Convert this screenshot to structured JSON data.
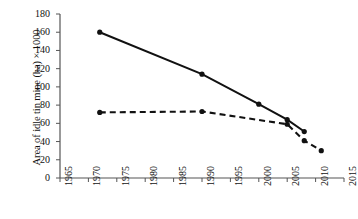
{
  "chart_data": {
    "type": "line",
    "title": "",
    "subtitle": "",
    "xlabel": "",
    "ylabel": "Area of idle tin mine (ha) × 1000",
    "xlim": [
      1965,
      2015
    ],
    "ylim": [
      0,
      180
    ],
    "grid": false,
    "legend": "none",
    "x_ticks": [
      "1965",
      "1970",
      "1975",
      "1980",
      "1985",
      "1990",
      "1995",
      "2000",
      "2005",
      "2010",
      "2015"
    ],
    "y_ticks": [
      "0",
      "20",
      "40",
      "60",
      "80",
      "100",
      "120",
      "140",
      "160",
      "180"
    ],
    "series": [
      {
        "name": "solid-series",
        "style": "solid",
        "color": "#111111",
        "marker": "circle",
        "x": [
          1972,
          1990,
          2000,
          2005,
          2008
        ],
        "values": [
          160,
          114,
          81,
          64,
          51
        ]
      },
      {
        "name": "dashed-series",
        "style": "dashed",
        "color": "#111111",
        "marker": "circle",
        "x": [
          1972,
          1990,
          2005,
          2008,
          2011
        ],
        "values": [
          72,
          73,
          59,
          41,
          30
        ]
      }
    ]
  },
  "axis": {
    "y_title": "Area of idle tin mine (ha) × 1000"
  }
}
